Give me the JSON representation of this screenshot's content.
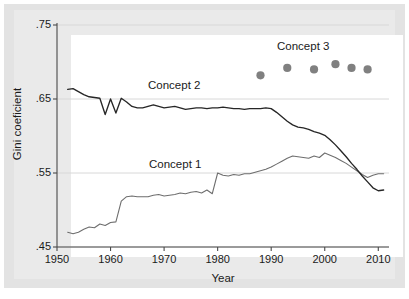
{
  "chart_data": {
    "type": "line",
    "title": "",
    "xlabel": "Year",
    "ylabel": "Gini coeficient",
    "xlim": [
      1950,
      2012
    ],
    "ylim": [
      0.45,
      0.75
    ],
    "xticks": [
      1950,
      1960,
      1970,
      1980,
      1990,
      2000,
      2010
    ],
    "xtick_labels": [
      "1950",
      "1960",
      "1970",
      "1980",
      "1990",
      "2000",
      "2010"
    ],
    "yticks": [
      0.45,
      0.55,
      0.65,
      0.75
    ],
    "ytick_labels": [
      ".45",
      ".55",
      ".65",
      ".75"
    ],
    "grid": "horizontal",
    "legend_position": "inline-annotations",
    "colors": {
      "concept1": "#6e6e6e",
      "concept2": "#262626",
      "concept3": "#808080",
      "gridline": "#d8d8d8",
      "axis": "#4a4a4a",
      "plot_background": "#ffffff",
      "figure_background": "#e3e3e3"
    },
    "series": [
      {
        "name": "Concept 1",
        "label": "Concept 1",
        "type": "line",
        "color": "#6e6e6e",
        "x": [
          1952,
          1953,
          1954,
          1955,
          1956,
          1957,
          1958,
          1959,
          1960,
          1961,
          1962,
          1963,
          1964,
          1965,
          1966,
          1967,
          1968,
          1969,
          1970,
          1971,
          1972,
          1973,
          1974,
          1975,
          1976,
          1977,
          1978,
          1979,
          1980,
          1981,
          1982,
          1983,
          1984,
          1985,
          1986,
          1987,
          1988,
          1989,
          1990,
          1991,
          1992,
          1993,
          1994,
          1995,
          1996,
          1997,
          1998,
          1999,
          2000,
          2001,
          2002,
          2003,
          2004,
          2005,
          2006,
          2007,
          2008,
          2009,
          2010,
          2011
        ],
        "y": [
          0.47,
          0.468,
          0.47,
          0.474,
          0.477,
          0.476,
          0.481,
          0.479,
          0.483,
          0.484,
          0.512,
          0.518,
          0.519,
          0.518,
          0.518,
          0.518,
          0.52,
          0.521,
          0.519,
          0.52,
          0.521,
          0.523,
          0.522,
          0.524,
          0.525,
          0.523,
          0.527,
          0.522,
          0.55,
          0.547,
          0.546,
          0.548,
          0.547,
          0.549,
          0.549,
          0.551,
          0.553,
          0.555,
          0.558,
          0.562,
          0.566,
          0.57,
          0.573,
          0.572,
          0.571,
          0.57,
          0.573,
          0.571,
          0.577,
          0.574,
          0.571,
          0.567,
          0.563,
          0.558,
          0.553,
          0.548,
          0.544,
          0.547,
          0.549,
          0.549
        ]
      },
      {
        "name": "Concept 2",
        "label": "Concept 2",
        "type": "line",
        "color": "#262626",
        "x": [
          1952,
          1953,
          1954,
          1955,
          1956,
          1957,
          1958,
          1959,
          1960,
          1961,
          1962,
          1963,
          1964,
          1965,
          1966,
          1967,
          1968,
          1969,
          1970,
          1971,
          1972,
          1973,
          1974,
          1975,
          1976,
          1977,
          1978,
          1979,
          1980,
          1981,
          1982,
          1983,
          1984,
          1985,
          1986,
          1987,
          1988,
          1989,
          1990,
          1991,
          1992,
          1993,
          1994,
          1995,
          1996,
          1997,
          1998,
          1999,
          2000,
          2001,
          2002,
          2003,
          2004,
          2005,
          2006,
          2007,
          2008,
          2009,
          2010,
          2011
        ],
        "y": [
          0.663,
          0.664,
          0.66,
          0.656,
          0.653,
          0.652,
          0.651,
          0.629,
          0.65,
          0.631,
          0.651,
          0.646,
          0.64,
          0.638,
          0.638,
          0.64,
          0.642,
          0.64,
          0.638,
          0.639,
          0.64,
          0.638,
          0.636,
          0.637,
          0.638,
          0.638,
          0.637,
          0.638,
          0.638,
          0.639,
          0.638,
          0.637,
          0.637,
          0.636,
          0.637,
          0.637,
          0.637,
          0.638,
          0.637,
          0.632,
          0.626,
          0.62,
          0.615,
          0.612,
          0.611,
          0.609,
          0.606,
          0.604,
          0.601,
          0.595,
          0.588,
          0.58,
          0.572,
          0.563,
          0.555,
          0.546,
          0.538,
          0.53,
          0.526,
          0.527
        ]
      },
      {
        "name": "Concept 3",
        "label": "Concept 3",
        "type": "scatter",
        "color": "#808080",
        "x": [
          1988,
          1993,
          1998,
          2002,
          2005,
          2008
        ],
        "y": [
          0.682,
          0.692,
          0.69,
          0.697,
          0.692,
          0.69
        ]
      }
    ]
  }
}
